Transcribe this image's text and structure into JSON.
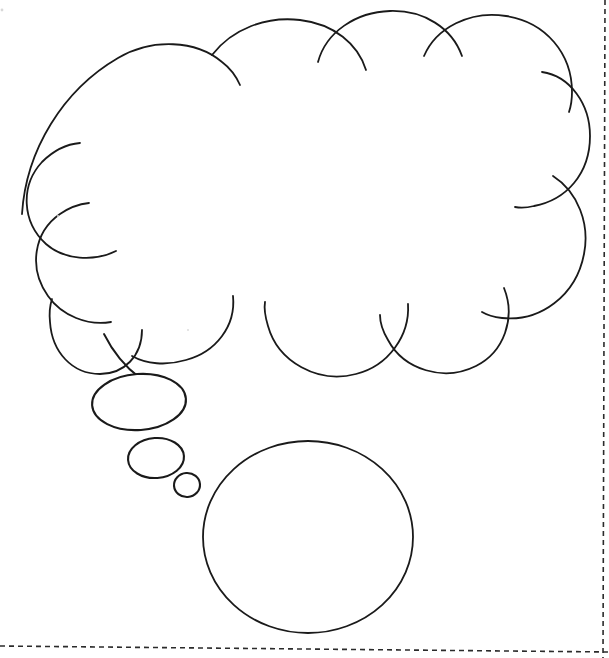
{
  "page": {
    "width": 609,
    "height": 658,
    "background_color": "#ffffff",
    "ink_color": "#1a1a1a",
    "guide_color": "#2b2b2b",
    "media": "hand-drawn line art on white paper"
  },
  "drawing": {
    "name": "thought-bubble-drawing",
    "shapes": [
      {
        "id": "cloud",
        "name": "thought-cloud",
        "label": "Thought cloud",
        "bounds": {
          "x": 20,
          "y": 8,
          "width": 571,
          "height": 382
        },
        "bump_count": 14,
        "stroke_width": 1.7,
        "filled": false
      },
      {
        "id": "tail-large",
        "name": "tail-ellipse-large",
        "label": "Large tail ellipse",
        "cx": 139,
        "cy": 402,
        "rx": 47,
        "ry": 28,
        "rotation": -4,
        "stroke_width": 2.1
      },
      {
        "id": "tail-medium",
        "name": "tail-ellipse-medium",
        "label": "Medium tail ellipse",
        "cx": 156,
        "cy": 458,
        "rx": 28,
        "ry": 20,
        "rotation": -4,
        "stroke_width": 2.1
      },
      {
        "id": "tail-small",
        "name": "tail-ellipse-small",
        "label": "Small tail ellipse",
        "cx": 187,
        "cy": 485,
        "rx": 13,
        "ry": 12,
        "rotation": -4,
        "stroke_width": 2.1
      },
      {
        "id": "circle-main",
        "name": "large-circle",
        "label": "Large empty circle",
        "cx": 308,
        "cy": 537,
        "rx": 105,
        "ry": 96,
        "stroke_width": 1.8
      }
    ]
  },
  "guides": {
    "name": "crop-guides",
    "items": [
      {
        "id": "guide-right",
        "name": "guide-line-right",
        "label": "Right dashed crop line",
        "orientation": "vertical",
        "x1": 605,
        "y1": 0,
        "x2": 603,
        "y2": 658
      },
      {
        "id": "guide-bottom",
        "name": "guide-line-bottom",
        "label": "Bottom dashed crop line",
        "orientation": "horizontal",
        "x1": 0,
        "y1": 646,
        "x2": 609,
        "y2": 652
      }
    ]
  },
  "marks": {
    "name": "paper-specks",
    "items": [
      {
        "id": "speck-1",
        "name": "paper-speck",
        "cx": 2,
        "cy": 10,
        "r": 1.4
      },
      {
        "id": "speck-2",
        "name": "paper-speck",
        "cx": 58,
        "cy": 216,
        "r": 1.0
      },
      {
        "id": "speck-3",
        "name": "paper-speck",
        "cx": 188,
        "cy": 330,
        "r": 0.9
      }
    ]
  }
}
